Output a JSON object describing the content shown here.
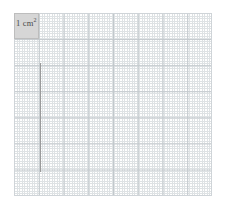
{
  "figure": {
    "background_color": "#ffffff",
    "width": 226,
    "height": 209
  },
  "grid": {
    "name": "graph-paper",
    "major_color": "#c2c8cc",
    "minor_color": "#d9dde0",
    "frame_color": "#cfd4d8",
    "major_cell_px": 25,
    "minor_cell_px": 5,
    "minor_per_major": 5,
    "columns_major": 8,
    "rows_major": 7
  },
  "unit_square": {
    "name": "shaded-unit-square",
    "label_text": "1 cm",
    "label_exponent": "2",
    "fill_color": "#d6d6d6",
    "border_color": "#bdbdbd"
  },
  "vertical_line": {
    "name": "drawn-vertical-line",
    "color": "#9a9a9a"
  }
}
